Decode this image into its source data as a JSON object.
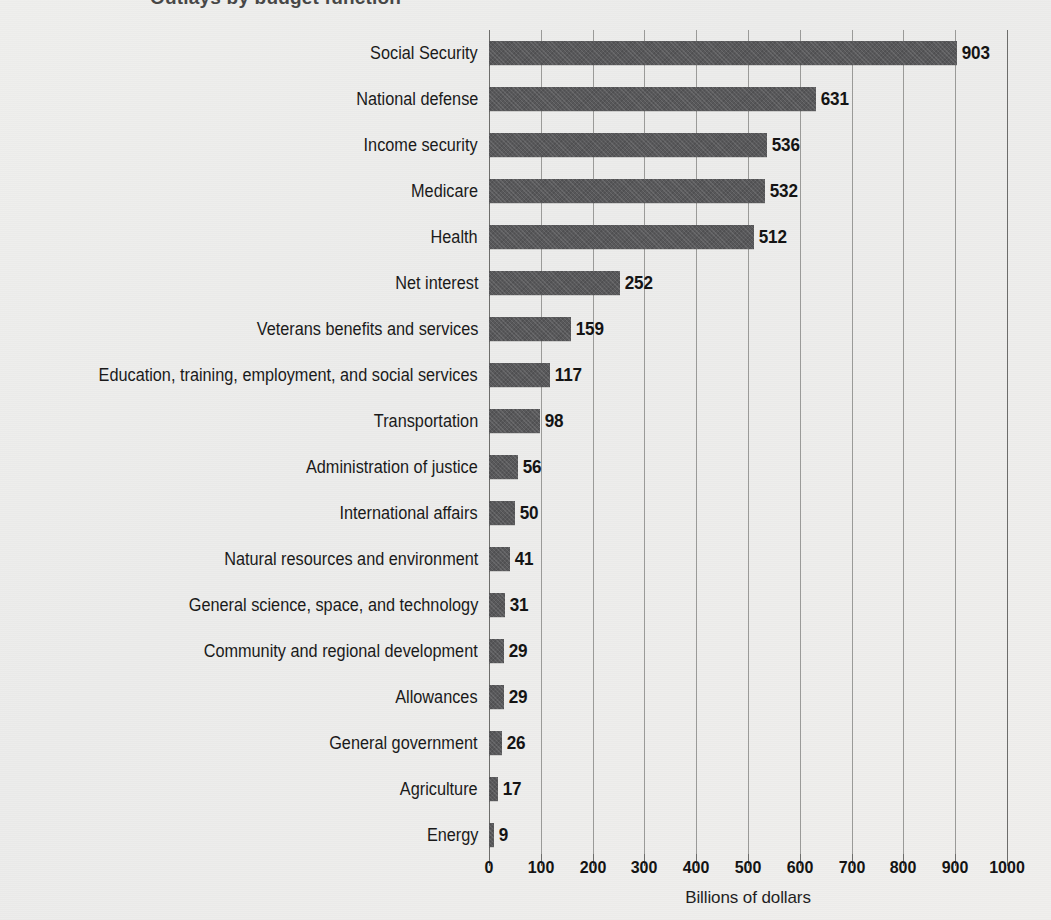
{
  "chart_data": {
    "type": "bar",
    "orientation": "horizontal",
    "title": "Outlays by budget function",
    "xlabel": "Billions of dollars",
    "ylabel": "",
    "xlim": [
      0,
      1000
    ],
    "xticks": [
      0,
      100,
      200,
      300,
      400,
      500,
      600,
      700,
      800,
      900,
      1000
    ],
    "grid": "vertical",
    "legend": "none",
    "bar_color": "#58585a",
    "categories": [
      "Social Security",
      "National defense",
      "Income security",
      "Medicare",
      "Health",
      "Net interest",
      "Veterans benefits and services",
      "Education, training, employment, and social services",
      "Transportation",
      "Administration of justice",
      "International affairs",
      "Natural resources and environment",
      "General science, space, and technology",
      "Community and regional development",
      "Allowances",
      "General government",
      "Agriculture",
      "Energy"
    ],
    "values": [
      903,
      631,
      536,
      532,
      512,
      252,
      159,
      117,
      98,
      56,
      50,
      41,
      31,
      29,
      29,
      26,
      17,
      9
    ],
    "value_labels": [
      "903",
      "631",
      "536",
      "532",
      "512",
      "252",
      "159",
      "117",
      "98",
      "56",
      "50",
      "41",
      "31",
      "29",
      "29",
      "26",
      "17",
      "9"
    ]
  },
  "axis": {
    "x_title": "Billions of dollars",
    "tick_labels": [
      "0",
      "100",
      "200",
      "300",
      "400",
      "500",
      "600",
      "700",
      "800",
      "900",
      "1000"
    ]
  }
}
